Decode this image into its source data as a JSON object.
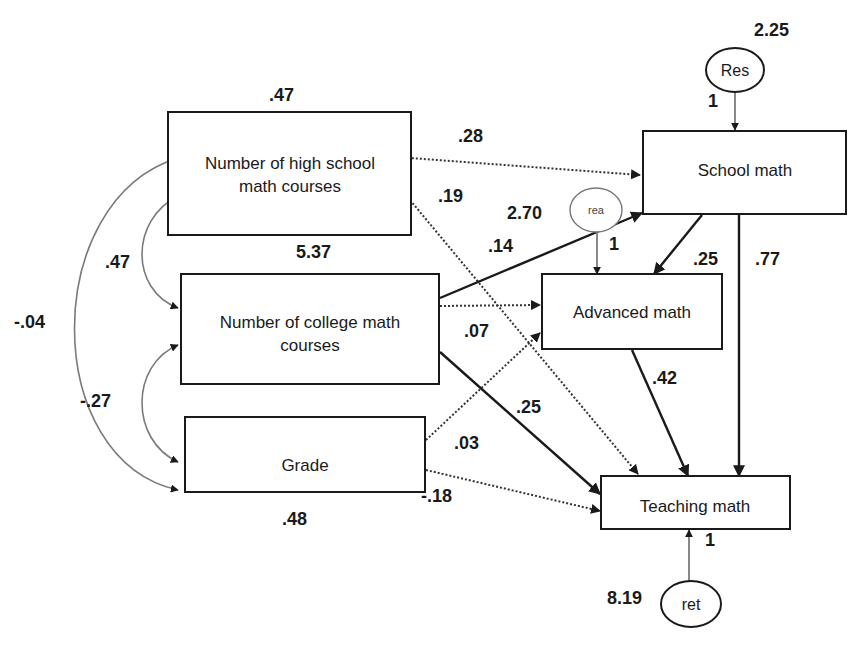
{
  "diagram": {
    "type": "path_diagram",
    "observed_variables": {
      "hs_courses": {
        "label_line1": "Number of high school",
        "label_line2": "math courses",
        "variance": ".47",
        "intercept": "5.37"
      },
      "college_courses": {
        "label_line1": "Number of college math",
        "label_line2": "courses"
      },
      "grade": {
        "label": "Grade",
        "variance": ".48"
      },
      "school_math": {
        "label": "School math"
      },
      "advanced_math": {
        "label": "Advanced math"
      },
      "teaching_math": {
        "label": "Teaching math"
      }
    },
    "residuals": {
      "res": {
        "label": "Res",
        "variance": "2.25",
        "loading": "1"
      },
      "rea": {
        "label": "rea",
        "variance": "2.70",
        "loading": "1"
      },
      "ret": {
        "label": "ret",
        "variance": "8.19",
        "loading": "1"
      }
    },
    "covariances": {
      "hs_college": ".47",
      "hs_grade": "-.04",
      "college_grade": "-.27"
    },
    "paths": {
      "hs_to_school": ".28",
      "hs_to_teaching": ".19",
      "college_to_school": ".14",
      "college_to_advanced": ".07",
      "college_to_teaching": ".25",
      "grade_to_advanced": ".03",
      "grade_to_teaching": "-.18",
      "school_to_advanced": ".25",
      "school_to_teaching": ".77",
      "advanced_to_teaching": ".42"
    }
  }
}
